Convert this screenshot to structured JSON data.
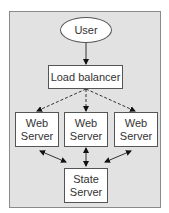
{
  "diagram": {
    "type": "architecture",
    "nodes": {
      "user": {
        "label": "User",
        "shape": "ellipse"
      },
      "load_balancer": {
        "label": "Load balancer",
        "shape": "rect"
      },
      "web_servers": [
        {
          "label": "Web Server"
        },
        {
          "label": "Web Server"
        },
        {
          "label": "Web Server"
        }
      ],
      "state_server": {
        "label": "State Server",
        "shape": "rect"
      }
    },
    "edges": [
      {
        "from": "User",
        "to": "Load balancer",
        "style": "solid",
        "arrow": "single"
      },
      {
        "from": "Load balancer",
        "to": "Web Server 1",
        "style": "dashed",
        "arrow": "single"
      },
      {
        "from": "Load balancer",
        "to": "Web Server 2",
        "style": "dashed",
        "arrow": "single"
      },
      {
        "from": "Load balancer",
        "to": "Web Server 3",
        "style": "dashed",
        "arrow": "single"
      },
      {
        "from": "Web Server 1",
        "to": "State Server",
        "style": "solid",
        "arrow": "double"
      },
      {
        "from": "Web Server 2",
        "to": "State Server",
        "style": "solid",
        "arrow": "double"
      },
      {
        "from": "Web Server 3",
        "to": "State Server",
        "style": "solid",
        "arrow": "double"
      }
    ],
    "colors": {
      "background": "#e2e2e2",
      "node_fill": "#ffffff",
      "stroke": "#333333"
    }
  }
}
